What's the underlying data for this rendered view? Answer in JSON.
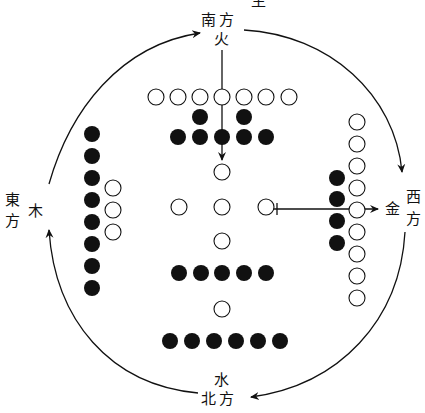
{
  "labels": {
    "south_dir": "南方",
    "south_elem": "火",
    "sheng": "生",
    "east_dir_1": "東",
    "east_dir_2": "方",
    "east_elem": "木",
    "west_dir_1": "西",
    "west_dir_2": "方",
    "west_elem": "金",
    "north_elem": "水",
    "north_dir": "北方"
  },
  "colors": {
    "ink": "#111111",
    "paper": "#ffffff"
  },
  "dots": {
    "radius": 8,
    "groups": [
      {
        "name": "south-outer-open-7",
        "type": "open",
        "points": [
          [
            156,
            97
          ],
          [
            178,
            97
          ],
          [
            200,
            97
          ],
          [
            222,
            97
          ],
          [
            244,
            97
          ],
          [
            266,
            97
          ],
          [
            289,
            97
          ]
        ]
      },
      {
        "name": "south-inner-black-2",
        "type": "filled",
        "points": [
          [
            200,
            117
          ],
          [
            244,
            117
          ]
        ]
      },
      {
        "name": "south-black-5",
        "type": "filled",
        "points": [
          [
            178,
            137
          ],
          [
            200,
            137
          ],
          [
            222,
            137
          ],
          [
            244,
            137
          ],
          [
            266,
            137
          ]
        ]
      },
      {
        "name": "center-open-5",
        "type": "open",
        "points": [
          [
            222,
            172
          ],
          [
            179,
            207
          ],
          [
            222,
            207
          ],
          [
            266,
            207
          ],
          [
            222,
            241
          ]
        ]
      },
      {
        "name": "center-black-5",
        "type": "filled",
        "points": [
          [
            179,
            273
          ],
          [
            201,
            273
          ],
          [
            222,
            273
          ],
          [
            244,
            273
          ],
          [
            266,
            273
          ]
        ]
      },
      {
        "name": "north-open-1",
        "type": "open",
        "points": [
          [
            222,
            309
          ]
        ]
      },
      {
        "name": "north-black-6",
        "type": "filled",
        "points": [
          [
            170,
            341
          ],
          [
            192,
            341
          ],
          [
            214,
            341
          ],
          [
            236,
            341
          ],
          [
            258,
            341
          ],
          [
            280,
            341
          ]
        ]
      },
      {
        "name": "east-black-8",
        "type": "filled",
        "points": [
          [
            92,
            134
          ],
          [
            92,
            156
          ],
          [
            92,
            178
          ],
          [
            92,
            200
          ],
          [
            92,
            222
          ],
          [
            92,
            244
          ],
          [
            92,
            266
          ],
          [
            92,
            288
          ]
        ]
      },
      {
        "name": "east-open-3",
        "type": "open",
        "points": [
          [
            113,
            188
          ],
          [
            113,
            210
          ],
          [
            113,
            232
          ]
        ]
      },
      {
        "name": "west-open-9",
        "type": "open",
        "points": [
          [
            357,
            122
          ],
          [
            357,
            144
          ],
          [
            357,
            166
          ],
          [
            357,
            188
          ],
          [
            357,
            210
          ],
          [
            357,
            232
          ],
          [
            357,
            254
          ],
          [
            357,
            276
          ],
          [
            357,
            298
          ]
        ]
      },
      {
        "name": "west-black-4",
        "type": "filled",
        "points": [
          [
            337,
            178
          ],
          [
            337,
            199
          ],
          [
            337,
            221
          ],
          [
            337,
            243
          ]
        ]
      }
    ]
  }
}
